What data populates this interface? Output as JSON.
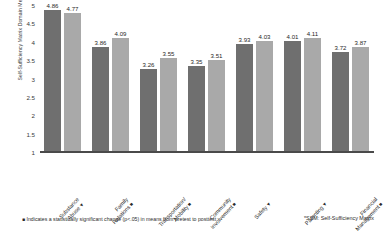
{
  "chart_data": {
    "type": "bar",
    "title": "",
    "xlabel": "",
    "ylabel": "Self-Sufficiency Matrix Domain Mean Scores",
    "ylim": [
      1,
      5
    ],
    "yticks": [
      "1",
      "1.5",
      "2",
      "2.5",
      "3",
      "3.5",
      "4",
      "4.5",
      "5"
    ],
    "grid": false,
    "legend_position": "none",
    "categories": [
      "Substance Abuse",
      "Family Relations",
      "Transportation/ Mobility",
      "Community Involvement",
      "Safety",
      "Parenting",
      "Financial Management"
    ],
    "category_markers": [
      "▼",
      "■",
      "■",
      "■",
      "▼",
      "▼",
      "■"
    ],
    "series": [
      {
        "name": "Pretest",
        "values": [
          4.86,
          3.86,
          3.26,
          3.35,
          3.93,
          4.01,
          3.72
        ],
        "color": "#6f6f6f"
      },
      {
        "name": "Posttest",
        "values": [
          4.77,
          4.09,
          3.55,
          3.51,
          4.03,
          4.11,
          3.87
        ],
        "color": "#a9a9a9"
      }
    ],
    "annotations": {
      "footnote_marker": "■",
      "footnote_left": "Indicates a statistically significant change (p<.05) in means from pretest to posttest",
      "footnote_right": "*SSM: Self-Sufficiency Matrix"
    }
  }
}
